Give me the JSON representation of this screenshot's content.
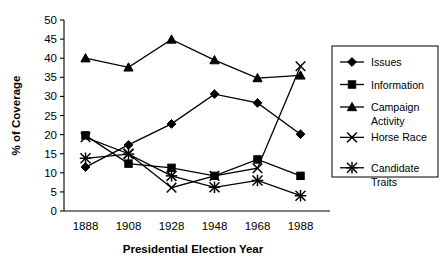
{
  "chart_data": {
    "type": "line",
    "title": "",
    "xlabel": "Presidential Election Year",
    "ylabel": "% of Coverage",
    "categories": [
      "1888",
      "1908",
      "1928",
      "1948",
      "1968",
      "1988"
    ],
    "x": [
      1888,
      1908,
      1928,
      1948,
      1968,
      1988
    ],
    "ylim": [
      0,
      50
    ],
    "yticks": [
      0,
      5,
      10,
      15,
      20,
      25,
      30,
      35,
      40,
      45,
      50
    ],
    "ytick_labels": [
      "0",
      "5",
      "10",
      "15",
      "20",
      "25",
      "30",
      "35",
      "40",
      "45",
      "50"
    ],
    "grid": false,
    "legend_position": "right",
    "series": [
      {
        "name": "Issues",
        "marker": "diamond",
        "values": [
          11.5,
          17.3,
          22.8,
          30.6,
          28.3,
          20.1
        ]
      },
      {
        "name": "Information",
        "marker": "square",
        "values": [
          19.8,
          12.4,
          11.3,
          9.2,
          13.5,
          9.2
        ]
      },
      {
        "name": "Campaign Activity",
        "marker": "triangle",
        "values": [
          40.0,
          37.6,
          44.9,
          39.5,
          34.8,
          35.5
        ]
      },
      {
        "name": "Horse Race",
        "marker": "cross",
        "values": [
          19.3,
          15.0,
          6.1,
          9.2,
          11.2,
          37.9
        ]
      },
      {
        "name": "Candidate Traits",
        "marker": "asterisk",
        "values": [
          13.8,
          14.9,
          9.2,
          6.2,
          8.0,
          4.0
        ]
      }
    ]
  },
  "legend": {
    "entries": [
      {
        "label": "Issues",
        "label2": ""
      },
      {
        "label": "Information",
        "label2": ""
      },
      {
        "label": "Campaign",
        "label2": "Activity"
      },
      {
        "label": "Horse Race",
        "label2": ""
      },
      {
        "label": "Candidate",
        "label2": "Traits"
      }
    ]
  },
  "colors": {
    "ink": "#000000",
    "background": "#ffffff"
  }
}
